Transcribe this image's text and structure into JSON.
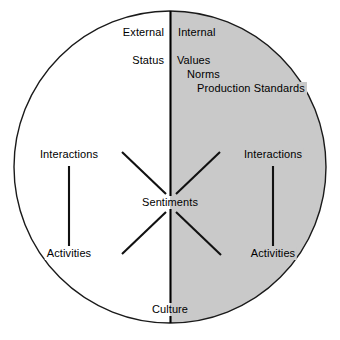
{
  "figure": {
    "shape": "circle-split-vertically",
    "colors": {
      "left_half_fill": "#ffffff",
      "right_half_fill": "#c9c9c9",
      "outline": "#1a1a1a",
      "text": "#000000",
      "divider": "#000000"
    },
    "geometry": {
      "center_x": 170,
      "center_y": 167,
      "radius": 156
    }
  },
  "halves": {
    "left": {
      "header": "External",
      "attribute": "Status",
      "top_node": "Interactions",
      "bottom_node": "Activities"
    },
    "right": {
      "header": "Internal",
      "attributes": [
        "Values",
        "Norms",
        "Production Standards"
      ],
      "top_node": "Interactions",
      "bottom_node": "Activities"
    }
  },
  "center": {
    "label": "Sentiments"
  },
  "bottom": {
    "label": "Culture"
  },
  "connectors": {
    "left_vertical": "Interactions-to-Activities",
    "right_vertical": "Interactions-to-Activities",
    "diagonals": [
      "upper-left-to-center",
      "lower-left-to-center",
      "upper-right-to-center",
      "lower-right-to-center"
    ]
  }
}
